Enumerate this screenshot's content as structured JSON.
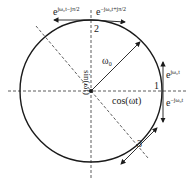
{
  "diagram": {
    "labels": {
      "omega0": "ω₀",
      "sin": "sin(ωt)",
      "cos": "cos(ωt)",
      "p1": "1",
      "p2": "2",
      "p3": "3",
      "top_left_base": "e",
      "top_left_exp": "jω₀t−jπ/2",
      "top_right_base": "e",
      "top_right_exp": "−jω₀t+jπ/2",
      "right_up_base": "e",
      "right_up_exp": "jω₀t",
      "right_down_base": "e",
      "right_down_exp": "−jω₀t"
    },
    "colors": {
      "stroke": "#1a1a1a"
    }
  }
}
